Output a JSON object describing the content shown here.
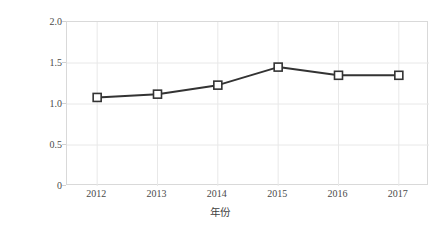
{
  "chart_data": {
    "type": "line",
    "title": "",
    "subtitle": "",
    "xlabel": "年份",
    "ylabel": "浓度/（mg/L）",
    "categories": [
      "2012",
      "2013",
      "2014",
      "2015",
      "2016",
      "2017"
    ],
    "values": [
      1.08,
      1.12,
      1.23,
      1.45,
      1.35,
      1.35
    ],
    "series": [
      {
        "name": "浓度",
        "values": [
          1.08,
          1.12,
          1.23,
          1.45,
          1.35,
          1.35
        ]
      }
    ],
    "ylim": [
      0,
      2.0
    ],
    "ytick_labels": [
      "0",
      "0.5",
      "1.0",
      "1.5",
      "2.0"
    ],
    "ytick_values": [
      0,
      0.5,
      1.0,
      1.5,
      2.0
    ],
    "xtick_labels": [
      "2012",
      "2013",
      "2014",
      "2015",
      "2016",
      "2017"
    ],
    "grid": {
      "horizontal": true,
      "vertical": true,
      "color": "#e8e8e8"
    },
    "legend": {
      "visible": false,
      "position": "none",
      "entries": []
    },
    "marker": {
      "shape": "square",
      "fill": "#ffffff",
      "edge": "#333333"
    },
    "line": {
      "color": "#333333",
      "width": 2
    },
    "annotations": [],
    "background": "#ffffff",
    "plot_border_color": "#d9d9d9"
  }
}
